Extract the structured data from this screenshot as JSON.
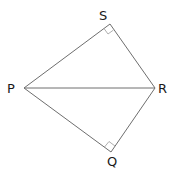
{
  "figure": {
    "type": "geometry-diagram",
    "vertices": {
      "P": {
        "label": "P"
      },
      "S": {
        "label": "S"
      },
      "R": {
        "label": "R"
      },
      "Q": {
        "label": "Q"
      }
    },
    "segments": [
      {
        "from": "P",
        "to": "S"
      },
      {
        "from": "S",
        "to": "R"
      },
      {
        "from": "R",
        "to": "Q"
      },
      {
        "from": "Q",
        "to": "P"
      },
      {
        "from": "P",
        "to": "R"
      }
    ],
    "right_angles": [
      "S",
      "Q"
    ]
  }
}
